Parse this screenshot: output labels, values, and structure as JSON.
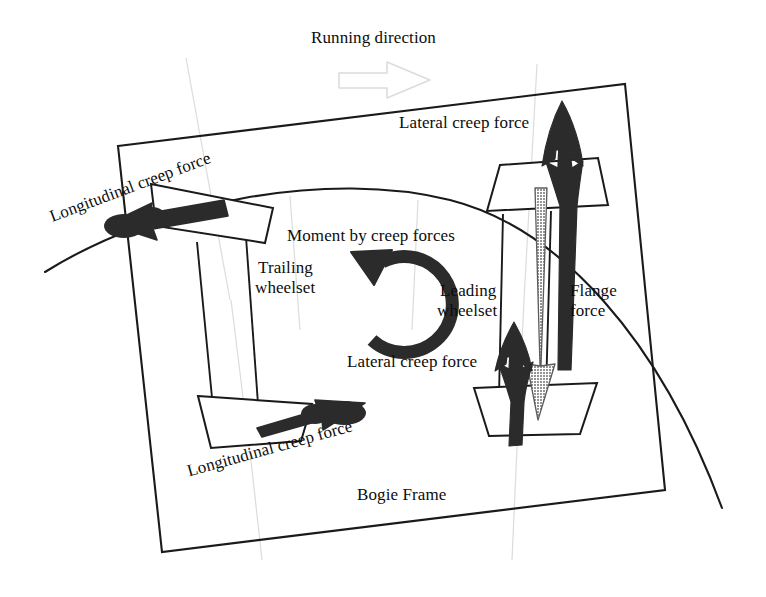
{
  "figure": {
    "type": "technical-diagram",
    "background_color": "#ffffff",
    "ink_color": "#111111",
    "faint_color": "#d8d8d8",
    "hatch_color": "#7a7a7a"
  },
  "labels": {
    "running_direction": "Running direction",
    "lateral_creep_force_top": "Lateral creep force",
    "longitudinal_creep_force_top": "Longitudinal creep force",
    "moment_by_creep_forces": "Moment by creep forces",
    "trailing_wheelset_line1": "Trailing",
    "trailing_wheelset_line2": "wheelset",
    "leading_wheelset_line1": "Leading",
    "leading_wheelset_line2": "wheelset",
    "flange_force_line1": "Flange",
    "flange_force_line2": "force",
    "lateral_creep_force_bottom": "Lateral creep force",
    "longitudinal_creep_force_bottom": "Longitudinal creep force",
    "bogie_frame": "Bogie Frame"
  },
  "elements": {
    "bogie_frame_outline": "quadrilateral",
    "rail_curve": "curved outer rail arc",
    "trailing_wheel_upper": "trapezoid wheel",
    "trailing_wheel_lower": "trapezoid wheel",
    "leading_wheel_upper": "trapezoid wheel",
    "leading_wheel_lower": "trapezoid wheel",
    "axle_trailing": "wheelset axle",
    "axle_leading": "wheelset axle",
    "arrow_longitudinal_top": "solid black arrow pointing left",
    "arrow_longitudinal_bottom": "solid black arrow pointing right",
    "arrow_lateral_leading_upper": "solid black arrow pointing up",
    "arrow_lateral_leading_lower": "solid black arrow pointing up",
    "arrow_flange_force": "hatched gray arrow pointing down",
    "arrow_moment": "thick curved counter-clockwise arrow",
    "arrow_running_direction": "faint outlined block arrow pointing right"
  }
}
